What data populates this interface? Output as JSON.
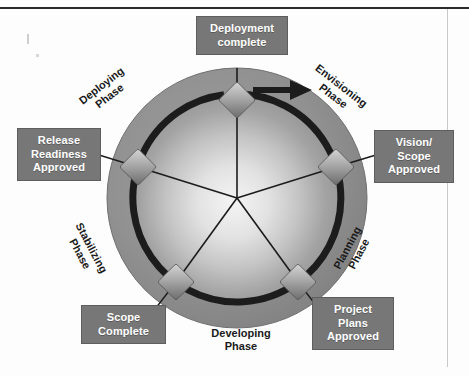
{
  "diagram": {
    "type": "circular-lifecycle",
    "rotation_direction": "clockwise",
    "colors": {
      "wheel_fill_outer": "#8d8d8d",
      "wheel_fill_inner": "#efefef",
      "ring_arc": "#1c1c1c",
      "callout_box": "#777777",
      "callout_text": "#ffffff",
      "phase_label_text": "#1a1a1a",
      "diamond_light": "#c9c9c9",
      "diamond_dark": "#6e6e6e",
      "spoke_line": "#1c1c1c",
      "page_rule": "#2b2b2b"
    }
  },
  "phases": [
    {
      "id": "envisioning",
      "label": "Envisioning\nPhase",
      "line1": "Envisioning",
      "line2": "Phase",
      "angle_deg": 36,
      "boxed": false
    },
    {
      "id": "planning",
      "label": "Planning\nPhase",
      "line1": "Planning",
      "line2": "Phase",
      "angle_deg": 108,
      "boxed": false
    },
    {
      "id": "developing",
      "label": "Developing\nPhase",
      "line1": "Developing",
      "line2": "Phase",
      "angle_deg": 180,
      "boxed": false
    },
    {
      "id": "stabilizing",
      "label": "Stabilizing\nPhase",
      "line1": "Stabilizing",
      "line2": "Phase",
      "angle_deg": 252,
      "boxed": false
    },
    {
      "id": "deploying",
      "label": "Deploying\nPhase",
      "line1": "Deploying",
      "line2": "Phase",
      "angle_deg": 324,
      "boxed": false
    }
  ],
  "milestones": [
    {
      "id": "deployment-complete",
      "lines": [
        "Deployment",
        "complete"
      ],
      "angle_deg": 0,
      "boxed": true
    },
    {
      "id": "vision-scope-approved",
      "lines": [
        "Vision/",
        "Scope",
        "Approved"
      ],
      "angle_deg": 72,
      "boxed": true
    },
    {
      "id": "project-plans-approved",
      "lines": [
        "Project",
        "Plans",
        "Approved"
      ],
      "angle_deg": 144,
      "boxed": true
    },
    {
      "id": "scope-complete",
      "lines": [
        "Scope",
        "Complete"
      ],
      "angle_deg": 216,
      "boxed": true
    },
    {
      "id": "release-readiness-approved",
      "lines": [
        "Release",
        "Readiness",
        "Approved"
      ],
      "angle_deg": 288,
      "boxed": true
    }
  ],
  "callouts": {
    "deployment_complete": {
      "line1": "Deployment",
      "line2": "complete"
    },
    "vision_scope_approved": {
      "line1": "Vision/",
      "line2": "Scope",
      "line3": "Approved"
    },
    "release_readiness_approved": {
      "line1": "Release",
      "line2": "Readiness",
      "line3": "Approved"
    },
    "scope_complete": {
      "line1": "Scope",
      "line2": "Complete"
    },
    "project_plans_approved": {
      "line1": "Project",
      "line2": "Plans",
      "line3": "Approved"
    }
  },
  "phase_labels": {
    "deploying": {
      "line1": "Deploying",
      "line2": "Phase"
    },
    "envisioning": {
      "line1": "Envisioning",
      "line2": "Phase"
    },
    "stabilizing": {
      "line1": "Stabilizing",
      "line2": "Phase"
    },
    "planning": {
      "line1": "Planning",
      "line2": "Phase"
    },
    "developing": {
      "line1": "Developing",
      "line2": "Phase"
    }
  }
}
